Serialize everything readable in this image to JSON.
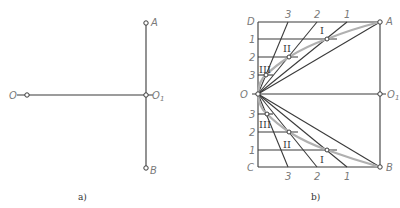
{
  "panel_a": {
    "caption": "a)",
    "labels": {
      "A": "A",
      "B": "B",
      "O": "O",
      "O1": "O",
      "O1_sub": "1"
    }
  },
  "panel_b": {
    "caption": "b)",
    "labels": {
      "D": "D",
      "C": "C",
      "A": "A",
      "B": "B",
      "O": "O",
      "O1": "O",
      "O1_sub": "1"
    },
    "top_divisions": [
      "3",
      "2",
      "1"
    ],
    "left_top_divisions": [
      "1",
      "2",
      "3"
    ],
    "left_bottom_divisions": [
      "3",
      "2",
      "1"
    ],
    "bottom_divisions": [
      "3",
      "2",
      "1"
    ],
    "roman_top": [
      "I",
      "II",
      "III"
    ],
    "roman_bottom": [
      "III",
      "II",
      "I"
    ]
  }
}
